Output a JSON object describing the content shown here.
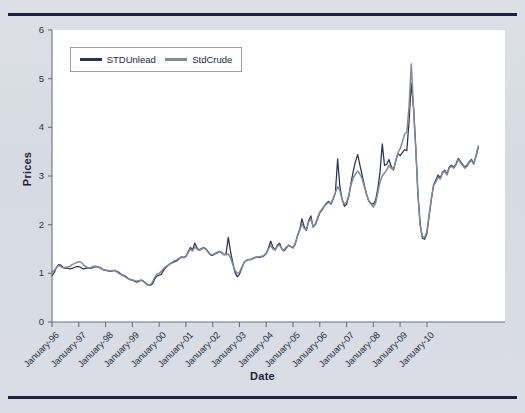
{
  "figure": {
    "background_color": "#d9dde4",
    "rule_color": "#1b2240",
    "plot_background": "#ffffff"
  },
  "axis": {
    "y_label": "Prices",
    "x_label": "Date",
    "y_ticks": [
      "0",
      "1",
      "2",
      "3",
      "4",
      "5",
      "6"
    ],
    "x_ticks": [
      "January-96",
      "January-97",
      "January-98",
      "January-99",
      "January-00",
      "January-01",
      "January-02",
      "January-03",
      "January-04",
      "January-05",
      "January-06",
      "January-07",
      "January-08",
      "January-09",
      "January-10"
    ]
  },
  "legend": {
    "entries": [
      {
        "label": "STDUnlead",
        "color": "#2a3152"
      },
      {
        "label": "StdCrude",
        "color": "#838996"
      }
    ]
  },
  "chart_data": {
    "type": "line",
    "title": "",
    "xlabel": "Date",
    "ylabel": "Prices",
    "xlim": [
      "January-96",
      "January-11"
    ],
    "ylim": [
      0,
      6
    ],
    "yticks": [
      0,
      1,
      2,
      3,
      4,
      5,
      6
    ],
    "grid": false,
    "legend_position": "top-left-inside",
    "x_tick_labels": [
      "January-96",
      "January-97",
      "January-98",
      "January-99",
      "January-00",
      "January-01",
      "January-02",
      "January-03",
      "January-04",
      "January-05",
      "January-06",
      "January-07",
      "January-08",
      "January-09",
      "January-10"
    ],
    "x_frequency": "monthly",
    "x_start": "1996-01",
    "x_end": "2010-12",
    "n_points": 180,
    "series": [
      {
        "name": "STDUnlead",
        "color": "#2a3152",
        "values": [
          0.95,
          1.02,
          1.12,
          1.18,
          1.17,
          1.12,
          1.1,
          1.11,
          1.09,
          1.1,
          1.12,
          1.14,
          1.14,
          1.12,
          1.09,
          1.1,
          1.11,
          1.1,
          1.11,
          1.13,
          1.14,
          1.13,
          1.11,
          1.07,
          1.06,
          1.05,
          1.04,
          1.05,
          1.06,
          1.04,
          1.02,
          0.98,
          0.96,
          0.94,
          0.9,
          0.87,
          0.86,
          0.84,
          0.82,
          0.84,
          0.86,
          0.84,
          0.8,
          0.76,
          0.75,
          0.78,
          0.88,
          0.95,
          0.96,
          0.98,
          1.06,
          1.12,
          1.16,
          1.2,
          1.22,
          1.24,
          1.26,
          1.3,
          1.34,
          1.33,
          1.35,
          1.44,
          1.53,
          1.48,
          1.62,
          1.52,
          1.48,
          1.51,
          1.53,
          1.5,
          1.44,
          1.38,
          1.37,
          1.4,
          1.42,
          1.45,
          1.42,
          1.38,
          1.4,
          1.74,
          1.45,
          1.22,
          1.02,
          0.93,
          0.98,
          1.1,
          1.22,
          1.26,
          1.28,
          1.28,
          1.3,
          1.32,
          1.34,
          1.33,
          1.34,
          1.36,
          1.4,
          1.52,
          1.66,
          1.54,
          1.48,
          1.58,
          1.62,
          1.5,
          1.46,
          1.52,
          1.58,
          1.55,
          1.52,
          1.6,
          1.78,
          1.9,
          2.12,
          1.96,
          1.88,
          2.08,
          2.18,
          1.95,
          2.0,
          2.12,
          2.24,
          2.3,
          2.38,
          2.44,
          2.48,
          2.42,
          2.52,
          2.66,
          3.35,
          2.78,
          2.52,
          2.38,
          2.42,
          2.58,
          2.86,
          3.1,
          3.3,
          3.44,
          3.22,
          3.02,
          2.8,
          2.62,
          2.48,
          2.44,
          2.42,
          2.5,
          2.74,
          3.08,
          3.66,
          3.22,
          3.24,
          3.34,
          3.2,
          3.12,
          3.3,
          3.46,
          3.42,
          3.48,
          3.54,
          3.52,
          4.12,
          4.9,
          4.42,
          3.6,
          2.62,
          2.0,
          1.72,
          1.7,
          1.82,
          2.18,
          2.52,
          2.82,
          2.92,
          3.02,
          2.96,
          3.08,
          3.12,
          3.04,
          3.18,
          3.22,
          3.18,
          3.24,
          3.36,
          3.3,
          3.24,
          3.18,
          3.22,
          3.3,
          3.34,
          3.26,
          3.4,
          3.58
        ]
      },
      {
        "name": "StdCrude",
        "color": "#838996",
        "values": [
          1.03,
          1.06,
          1.12,
          1.16,
          1.14,
          1.11,
          1.12,
          1.13,
          1.14,
          1.18,
          1.2,
          1.22,
          1.24,
          1.23,
          1.18,
          1.14,
          1.12,
          1.11,
          1.13,
          1.15,
          1.14,
          1.12,
          1.1,
          1.08,
          1.07,
          1.06,
          1.05,
          1.06,
          1.06,
          1.03,
          1.0,
          0.97,
          0.95,
          0.92,
          0.89,
          0.88,
          0.87,
          0.85,
          0.84,
          0.85,
          0.86,
          0.83,
          0.79,
          0.76,
          0.76,
          0.82,
          0.92,
          0.98,
          1.0,
          1.04,
          1.1,
          1.14,
          1.17,
          1.2,
          1.23,
          1.26,
          1.28,
          1.31,
          1.33,
          1.32,
          1.34,
          1.42,
          1.5,
          1.46,
          1.54,
          1.5,
          1.47,
          1.5,
          1.52,
          1.49,
          1.43,
          1.39,
          1.38,
          1.41,
          1.43,
          1.45,
          1.43,
          1.39,
          1.38,
          1.4,
          1.32,
          1.18,
          1.06,
          1.0,
          1.02,
          1.12,
          1.22,
          1.27,
          1.28,
          1.29,
          1.31,
          1.33,
          1.34,
          1.34,
          1.35,
          1.37,
          1.42,
          1.5,
          1.58,
          1.5,
          1.48,
          1.56,
          1.58,
          1.5,
          1.48,
          1.54,
          1.57,
          1.55,
          1.53,
          1.62,
          1.76,
          1.88,
          2.02,
          1.92,
          1.9,
          2.06,
          2.12,
          1.96,
          2.02,
          2.14,
          2.26,
          2.32,
          2.38,
          2.42,
          2.46,
          2.44,
          2.54,
          2.66,
          2.78,
          2.7,
          2.52,
          2.42,
          2.46,
          2.6,
          2.82,
          2.96,
          3.04,
          3.1,
          3.04,
          2.94,
          2.78,
          2.62,
          2.48,
          2.42,
          2.36,
          2.44,
          2.66,
          2.88,
          3.0,
          3.06,
          3.12,
          3.22,
          3.16,
          3.14,
          3.3,
          3.48,
          3.56,
          3.7,
          3.86,
          3.9,
          4.42,
          5.3,
          4.4,
          3.56,
          2.6,
          1.98,
          1.76,
          1.74,
          1.86,
          2.2,
          2.54,
          2.8,
          2.88,
          2.98,
          2.94,
          3.06,
          3.1,
          3.02,
          3.16,
          3.2,
          3.16,
          3.22,
          3.34,
          3.28,
          3.22,
          3.16,
          3.2,
          3.28,
          3.32,
          3.24,
          3.42,
          3.62
        ]
      }
    ]
  }
}
